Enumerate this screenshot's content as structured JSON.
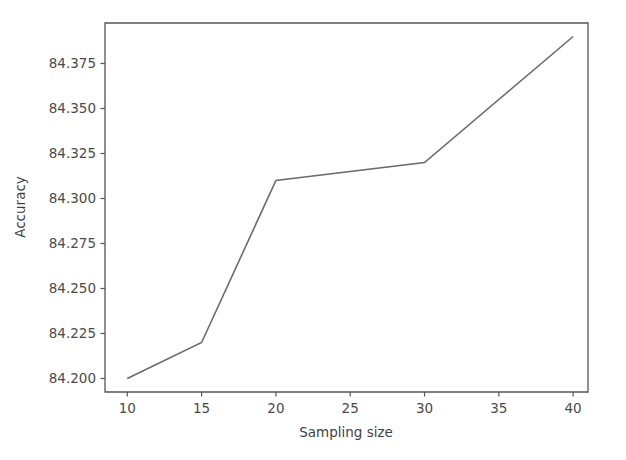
{
  "chart_data": {
    "type": "line",
    "title": "",
    "xlabel": "Sampling size",
    "ylabel": "Accuracy",
    "x": [
      10,
      15,
      20,
      30,
      40
    ],
    "values": [
      84.2,
      84.22,
      84.31,
      84.32,
      84.39
    ],
    "series": [
      {
        "name": "accuracy",
        "color": "#6b6b6b",
        "x": [
          10,
          15,
          20,
          30,
          40
        ],
        "values": [
          84.2,
          84.22,
          84.31,
          84.32,
          84.39
        ]
      }
    ],
    "xlim": [
      8.5,
      41.0
    ],
    "ylim": [
      84.1925,
      84.3975
    ],
    "xticks": [
      10,
      15,
      20,
      25,
      30,
      35,
      40
    ],
    "xtick_labels": [
      "10",
      "15",
      "20",
      "25",
      "30",
      "35",
      "40"
    ],
    "yticks": [
      84.2,
      84.225,
      84.25,
      84.275,
      84.3,
      84.325,
      84.35,
      84.375
    ],
    "ytick_labels": [
      "84.200",
      "84.225",
      "84.250",
      "84.275",
      "84.300",
      "84.325",
      "84.350",
      "84.375"
    ],
    "grid": false,
    "legend": null,
    "legend_position": "none",
    "annotations": [],
    "background_color": "#ffffff",
    "axis_color": "#555555"
  },
  "axis": {
    "x_title": "Sampling size",
    "y_title": "Accuracy"
  }
}
